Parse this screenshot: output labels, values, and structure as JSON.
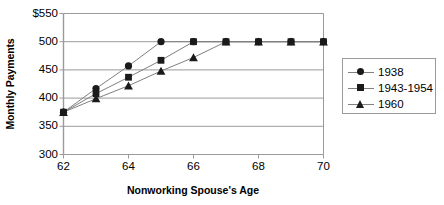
{
  "chart_data": {
    "type": "line",
    "title": "",
    "xlabel": "Nonworking Spouse's Age",
    "ylabel": "Monthly Payments",
    "x": [
      62,
      63,
      64,
      65,
      66,
      67,
      68,
      69,
      70
    ],
    "xlim": [
      62,
      70
    ],
    "ylim": [
      300,
      550
    ],
    "xticks": [
      "62",
      "64",
      "66",
      "68",
      "70"
    ],
    "yticks": [
      "$550",
      "500",
      "450",
      "400",
      "350",
      "300"
    ],
    "grid": "horizontal",
    "legend_position": "right",
    "series": [
      {
        "name": "1938",
        "marker": "circle",
        "values": [
          375,
          417,
          457,
          500,
          500,
          500,
          500,
          500,
          500
        ]
      },
      {
        "name": "1943-1954",
        "marker": "square",
        "values": [
          375,
          408,
          437,
          467,
          500,
          500,
          500,
          500,
          500
        ]
      },
      {
        "name": "1960",
        "marker": "triangle",
        "values": [
          375,
          399,
          422,
          448,
          472,
          500,
          500,
          500,
          500
        ]
      }
    ],
    "colors": {
      "marker": "#1a1a1a",
      "line": "#808080",
      "grid": "#9a9a9a",
      "axis": "#9a9a9a",
      "text": "#000000"
    }
  },
  "axis_titles": {
    "y": "Monthly Payments",
    "x": "Nonworking Spouse's Age"
  },
  "y_ticks": [
    {
      "label": "$550",
      "value": 550
    },
    {
      "label": "500",
      "value": 500
    },
    {
      "label": "450",
      "value": 450
    },
    {
      "label": "400",
      "value": 400
    },
    {
      "label": "350",
      "value": 350
    },
    {
      "label": "300",
      "value": 300
    }
  ],
  "x_ticks": [
    {
      "label": "62",
      "value": 62
    },
    {
      "label": "64",
      "value": 64
    },
    {
      "label": "66",
      "value": 66
    },
    {
      "label": "68",
      "value": 68
    },
    {
      "label": "70",
      "value": 70
    }
  ],
  "legend": {
    "entries": [
      {
        "label": "1938",
        "marker": "circle-marker-icon"
      },
      {
        "label": "1943-1954",
        "marker": "square-marker-icon"
      },
      {
        "label": "1960",
        "marker": "triangle-marker-icon"
      }
    ]
  }
}
